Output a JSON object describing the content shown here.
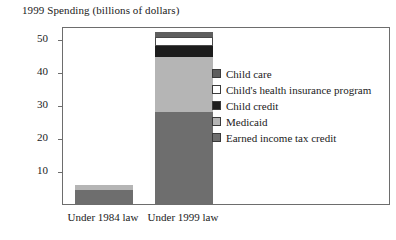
{
  "chart_data": {
    "type": "bar",
    "subtype": "stacked-vertical",
    "title": "1999 Spending (billions of dollars)",
    "xlabel": "",
    "ylabel": "",
    "ylim": [
      0,
      55
    ],
    "yticks": [
      10,
      20,
      30,
      40,
      50
    ],
    "ytick_labels": [
      "10",
      "20",
      "30",
      "40",
      "50"
    ],
    "grid": false,
    "legend_position": "right-inside",
    "categories": [
      "Under 1984 law",
      "Under 1999 law"
    ],
    "series": [
      {
        "name": "Child care",
        "color": "#5e5e5e",
        "values": [
          0.0,
          1.5
        ]
      },
      {
        "name": "Child's health insurance program",
        "color": "#ffffff",
        "values": [
          0.0,
          2.7
        ]
      },
      {
        "name": "Child credit",
        "color": "#1c1c1c",
        "values": [
          0.0,
          3.3
        ]
      },
      {
        "name": "Medicaid",
        "color": "#b5b5b5",
        "values": [
          1.5,
          16.5
        ]
      },
      {
        "name": "Earned income tax credit",
        "color": "#6e6e6e",
        "values": [
          4.2,
          28.0
        ]
      }
    ],
    "totals": [
      5.7,
      52.0
    ],
    "stack_order_bottom_to_top": [
      "Earned income tax credit",
      "Medicaid",
      "Child credit",
      "Child's health insurance program",
      "Child care"
    ]
  },
  "legend": {
    "items": [
      {
        "label": "Child care",
        "color": "#5e5e5e"
      },
      {
        "label": "Child's health insurance program",
        "color": "#ffffff"
      },
      {
        "label": "Child credit",
        "color": "#1c1c1c"
      },
      {
        "label": "Medicaid",
        "color": "#b5b5b5"
      },
      {
        "label": "Earned income tax credit",
        "color": "#6e6e6e"
      }
    ]
  },
  "axes": {
    "y_ticks": [
      "10",
      "20",
      "30",
      "40",
      "50"
    ],
    "x_labels": [
      "Under 1984 law",
      "Under 1999 law"
    ]
  },
  "colors": {
    "frame": "#6d6d6d",
    "text": "#1a1a1a",
    "background": "#ffffff"
  }
}
